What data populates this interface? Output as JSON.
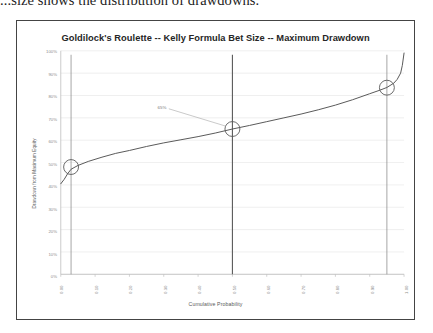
{
  "document": {
    "clipped_line": "...size shows the distribution of drawdowns."
  },
  "figure": {
    "title": "Goldilock's Roulette -- Kelly Formula Bet Size -- Maximum Drawdown"
  },
  "chart_data": {
    "type": "line",
    "title": "Goldilock's Roulette -- Kelly Formula Bet Size -- Maximum Drawdown",
    "xlabel": "Cumulative Probability",
    "ylabel": "Drawdown from Maximum Equity",
    "xlim": [
      0,
      1
    ],
    "ylim": [
      0,
      1
    ],
    "grid": true,
    "legend": "none",
    "x_tick_labels": [
      "0.00",
      "0.10",
      "0.20",
      "0.30",
      "0.40",
      "0.50",
      "0.60",
      "0.70",
      "0.80",
      "0.90",
      "1.00"
    ],
    "x_tick_values": [
      0.0,
      0.1,
      0.2,
      0.3,
      0.4,
      0.5,
      0.6,
      0.7,
      0.8,
      0.9,
      1.0
    ],
    "y_tick_labels": [
      "0%",
      "10%",
      "20%",
      "30%",
      "40%",
      "50%",
      "60%",
      "70%",
      "80%",
      "90%",
      "100%"
    ],
    "y_tick_values": [
      0.0,
      0.1,
      0.2,
      0.3,
      0.4,
      0.5,
      0.6,
      0.7,
      0.8,
      0.9,
      1.0
    ],
    "series": [
      {
        "name": "Maximum Drawdown",
        "x": [
          0.0,
          0.01,
          0.02,
          0.03,
          0.05,
          0.08,
          0.12,
          0.16,
          0.2,
          0.25,
          0.3,
          0.35,
          0.4,
          0.45,
          0.5,
          0.55,
          0.6,
          0.65,
          0.7,
          0.75,
          0.8,
          0.85,
          0.9,
          0.93,
          0.95,
          0.97,
          0.98,
          0.99,
          0.995,
          1.0
        ],
        "y": [
          0.405,
          0.425,
          0.45,
          0.47,
          0.487,
          0.505,
          0.524,
          0.541,
          0.554,
          0.572,
          0.588,
          0.602,
          0.616,
          0.632,
          0.65,
          0.666,
          0.683,
          0.7,
          0.717,
          0.736,
          0.757,
          0.781,
          0.808,
          0.824,
          0.836,
          0.855,
          0.872,
          0.9,
          0.935,
          0.99
        ]
      }
    ],
    "markers": [
      {
        "name": "lower-percentile-marker",
        "x": 0.03,
        "y": 0.48,
        "shape": "circle"
      },
      {
        "name": "median-marker",
        "x": 0.5,
        "y": 0.65,
        "shape": "circle",
        "label": "65%"
      },
      {
        "name": "upper-percentile-marker",
        "x": 0.95,
        "y": 0.835,
        "shape": "circle"
      }
    ],
    "vertical_lines": [
      {
        "name": "lower-percentile-line",
        "x": 0.03
      },
      {
        "name": "median-line",
        "x": 0.5
      },
      {
        "name": "upper-percentile-line",
        "x": 0.95
      }
    ],
    "annotations": [
      {
        "name": "median-callout",
        "text": "65%",
        "x": 0.28,
        "y": 0.745,
        "points_to": [
          0.5,
          0.65
        ]
      }
    ]
  },
  "colors": {
    "curve": "#595959",
    "gridline": "#e8e8e8",
    "axis": "#bfbfbf",
    "vertical_line": "#808080",
    "median_line": "#595959",
    "frame": "#444444",
    "title": "#262626",
    "tick_text": "#8c8c8c"
  }
}
